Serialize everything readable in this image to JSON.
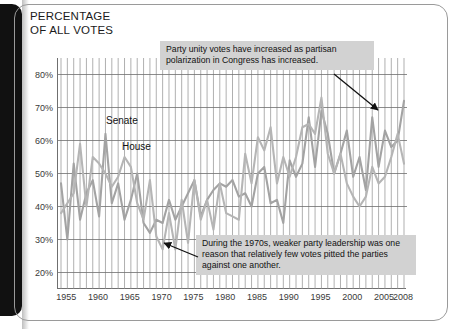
{
  "page": {
    "title_line1": "PERCENTAGE",
    "title_line2": "OF ALL VOTES",
    "title": "PERCENTAGE\nOF ALL VOTES"
  },
  "annotations": {
    "top": "Party unity votes have increased as partisan polarization in Congress has increased.",
    "bottom": "During the 1970s, weaker party leadership was one reason that relatively few votes pitted the parties against one another."
  },
  "series_labels": {
    "senate": "Senate",
    "house": "House"
  },
  "colors": {
    "senate_line": "#a3a3a3",
    "house_line": "#b5b5b5",
    "gridline_vertical": "#8e8e8e",
    "gridline_horizontal": "#6f6f6f",
    "axis": "#6f6f6f",
    "note_background": "#d2d2d2",
    "text": "#1b1b1b",
    "spine": "#111111"
  },
  "chart_data": {
    "type": "line",
    "title": "PERCENTAGE OF ALL VOTES",
    "xlabel": "",
    "ylabel": "PERCENTAGE OF ALL VOTES",
    "xlim": [
      1954,
      2008
    ],
    "ylim": [
      15,
      85
    ],
    "ytick_values": [
      20,
      30,
      40,
      50,
      60,
      70,
      80
    ],
    "ytick_labels": [
      "20%",
      "30%",
      "40%",
      "50%",
      "60%",
      "70%",
      "80%"
    ],
    "xtick_values": [
      1955,
      1960,
      1965,
      1970,
      1975,
      1980,
      1985,
      1990,
      1995,
      2000,
      2005,
      2008
    ],
    "xtick_labels": [
      "1955",
      "1960",
      "1965",
      "1970",
      "1975",
      "1980",
      "1985",
      "1990",
      "1995",
      "2000",
      "2005",
      "2008"
    ],
    "grid": {
      "vertical": "every year",
      "horizontal": "every 10 percent"
    },
    "legend": {
      "position": "inline-labels",
      "entries": [
        "Senate",
        "House"
      ]
    },
    "x": [
      1954,
      1955,
      1956,
      1957,
      1958,
      1959,
      1960,
      1961,
      1962,
      1963,
      1964,
      1965,
      1966,
      1967,
      1968,
      1969,
      1970,
      1971,
      1972,
      1973,
      1974,
      1975,
      1976,
      1977,
      1978,
      1979,
      1980,
      1981,
      1982,
      1983,
      1984,
      1985,
      1986,
      1987,
      1988,
      1989,
      1990,
      1991,
      1992,
      1993,
      1994,
      1995,
      1996,
      1997,
      1998,
      1999,
      2000,
      2001,
      2002,
      2003,
      2004,
      2005,
      2006,
      2007,
      2008
    ],
    "series": [
      {
        "name": "Senate",
        "values": [
          47,
          30,
          53,
          36,
          44,
          48,
          37,
          62,
          41,
          47,
          36,
          42,
          50,
          35,
          32,
          36,
          35,
          42,
          36,
          40,
          44,
          48,
          37,
          42,
          45,
          47,
          46,
          48,
          43,
          44,
          40,
          50,
          52,
          41,
          42,
          35,
          54,
          49,
          53,
          67,
          52,
          69,
          62,
          50,
          56,
          63,
          49,
          55,
          45,
          67,
          52,
          63,
          58,
          60,
          72
        ]
      },
      {
        "name": "House",
        "values": [
          38,
          41,
          44,
          59,
          40,
          55,
          53,
          50,
          46,
          49,
          55,
          52,
          41,
          36,
          48,
          31,
          27,
          38,
          27,
          42,
          29,
          48,
          36,
          42,
          33,
          47,
          38,
          37,
          36,
          56,
          47,
          61,
          57,
          64,
          47,
          55,
          49,
          55,
          64,
          65,
          62,
          73,
          56,
          50,
          56,
          47,
          43,
          40,
          43,
          52,
          47,
          49,
          55,
          62,
          53
        ]
      }
    ]
  }
}
